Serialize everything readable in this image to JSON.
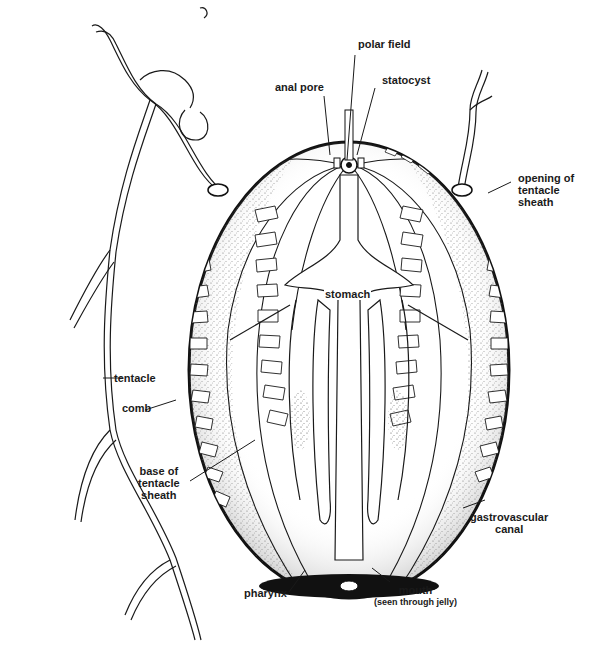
{
  "diagram": {
    "labels": {
      "polar_field": "polar field",
      "statocyst": "statocyst",
      "anal_pore": "anal pore",
      "opening_of_tentacle_sheath": [
        "opening of",
        "tentacle",
        "sheath"
      ],
      "stomach": "stomach",
      "tentacle": "tentacle",
      "comb": "comb",
      "base_of_tentacle_sheath": [
        "base of",
        "tentacle",
        "sheath"
      ],
      "gastrovascular_canal": [
        "gastrovascular",
        "canal"
      ],
      "pharynx": "pharynx",
      "mouth": "mouth",
      "mouth_note": "(seen through jelly)"
    },
    "colors": {
      "ink": "#1a1a1a",
      "background": "#ffffff",
      "stipple": "#6b6b6b"
    }
  }
}
